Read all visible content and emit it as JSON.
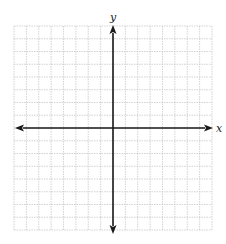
{
  "diagram": {
    "type": "coordinate-plane",
    "grid": {
      "columns": 16,
      "rows": 16,
      "left": 14,
      "top": 26,
      "right": 212,
      "bottom": 230,
      "line_color": "#c8c8c8",
      "line_style": "dotted"
    },
    "axes": {
      "color": "#1a1a1a",
      "origin_column": 8,
      "origin_row": 8,
      "x_label": "x",
      "y_label": "y",
      "x_arrow_left": true,
      "x_arrow_right": true,
      "y_arrow_up": true,
      "y_arrow_down": true
    }
  }
}
